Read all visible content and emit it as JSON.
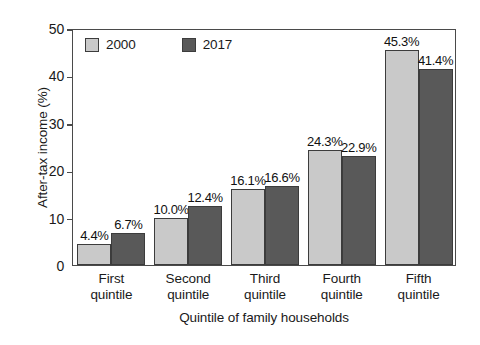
{
  "chart_data": {
    "type": "bar",
    "title": "",
    "subtitle": "",
    "xlabel": "Quintile of family households",
    "ylabel": "After-tax income (%)",
    "categories": [
      "First quintile",
      "Second quintile",
      "Third quintile",
      "Fourth quintile",
      "Fifth quintile"
    ],
    "category_lines": [
      [
        "First",
        "quintile"
      ],
      [
        "Second",
        "quintile"
      ],
      [
        "Third",
        "quintile"
      ],
      [
        "Fourth",
        "quintile"
      ],
      [
        "Fifth",
        "quintile"
      ]
    ],
    "series": [
      {
        "name": "2000",
        "color": "#c9c9c9",
        "values": [
          4.4,
          10.0,
          16.1,
          24.3,
          45.3
        ],
        "labels": [
          "4.4%",
          "10.0%",
          "16.1%",
          "24.3%",
          "45.3%"
        ]
      },
      {
        "name": "2017",
        "color": "#595959",
        "values": [
          6.7,
          12.4,
          16.6,
          22.9,
          41.4
        ],
        "labels": [
          "6.7%",
          "12.4%",
          "16.6%",
          "22.9%",
          "41.4%"
        ]
      }
    ],
    "ylim": [
      0,
      50
    ],
    "yticks": [
      0,
      10,
      20,
      30,
      40,
      50
    ],
    "ytick_labels": [
      "0",
      "10",
      "20",
      "30",
      "40",
      "50"
    ],
    "grid": false,
    "legend_position": "top-left",
    "frame": true,
    "axis_color": "#4a4a4a",
    "bar_edge_color": "#3c3c3c",
    "text_color": "#1a1a1a",
    "background": "#ffffff"
  },
  "legend": {
    "items": [
      {
        "label": "2000",
        "color": "#c9c9c9"
      },
      {
        "label": "2017",
        "color": "#595959"
      }
    ]
  }
}
